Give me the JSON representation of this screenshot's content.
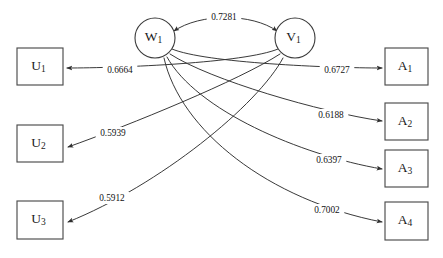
{
  "diagram": {
    "type": "path-diagram",
    "background_color": "#ffffff",
    "stroke_color": "#2e2e2e",
    "latent_nodes": [
      {
        "id": "W1",
        "base": "W",
        "subscript": "1",
        "shape": "circle",
        "cx": 155,
        "cy": 38,
        "r": 20
      },
      {
        "id": "V1",
        "base": "V",
        "subscript": "1",
        "shape": "circle",
        "cx": 295,
        "cy": 38,
        "r": 20
      }
    ],
    "left_nodes": [
      {
        "id": "U1",
        "base": "U",
        "subscript": "1",
        "shape": "rect",
        "x": 17,
        "y": 48,
        "w": 46,
        "h": 37
      },
      {
        "id": "U2",
        "base": "U",
        "subscript": "2",
        "shape": "rect",
        "x": 17,
        "y": 125,
        "w": 46,
        "h": 37
      },
      {
        "id": "U3",
        "base": "U",
        "subscript": "3",
        "shape": "rect",
        "x": 17,
        "y": 201,
        "w": 46,
        "h": 38
      }
    ],
    "right_nodes": [
      {
        "id": "A1",
        "base": "A",
        "subscript": "1",
        "shape": "rect",
        "x": 385,
        "y": 48,
        "w": 43,
        "h": 37
      },
      {
        "id": "A2",
        "base": "A",
        "subscript": "2",
        "shape": "rect",
        "x": 385,
        "y": 103,
        "w": 43,
        "h": 37
      },
      {
        "id": "A3",
        "base": "A",
        "subscript": "3",
        "shape": "rect",
        "x": 385,
        "y": 150,
        "w": 43,
        "h": 37
      },
      {
        "id": "A4",
        "base": "A",
        "subscript": "4",
        "shape": "rect",
        "x": 385,
        "y": 202,
        "w": 43,
        "h": 38
      }
    ],
    "edges": [
      {
        "name": "edge-W1-V1",
        "from": "W1",
        "to": "V1",
        "coefficient": "0.7281",
        "bidirectional": true,
        "label_x": 224,
        "label_y": 17,
        "path": "M 174 31 C 200 13, 252 13, 277 31"
      },
      {
        "name": "edge-V1-U1",
        "from": "V1",
        "to": "U1",
        "coefficient": "0.6664",
        "bidirectional": false,
        "label_x": 120,
        "label_y": 70,
        "path": "M 278 49 C 245 63, 120 68, 67 68"
      },
      {
        "name": "edge-V1-U2",
        "from": "V1",
        "to": "U2",
        "coefficient": "0.5939",
        "bidirectional": false,
        "label_x": 113,
        "label_y": 133,
        "path": "M 280 54 C 240 80, 130 125, 68 147"
      },
      {
        "name": "edge-V1-U3",
        "from": "V1",
        "to": "U3",
        "coefficient": "0.5912",
        "bidirectional": false,
        "label_x": 112,
        "label_y": 198,
        "path": "M 283 58 C 258 105, 160 185, 68 222"
      },
      {
        "name": "edge-W1-A1",
        "from": "W1",
        "to": "A1",
        "coefficient": "0.6727",
        "bidirectional": false,
        "label_x": 337,
        "label_y": 70,
        "path": "M 172 49 C 205 63, 330 68, 382 68"
      },
      {
        "name": "edge-W1-A2",
        "from": "W1",
        "to": "A2",
        "coefficient": "0.6188",
        "bidirectional": false,
        "label_x": 331,
        "label_y": 115,
        "path": "M 170 54 C 210 80, 320 112, 382 121"
      },
      {
        "name": "edge-W1-A3",
        "from": "W1",
        "to": "A3",
        "coefficient": "0.6397",
        "bidirectional": false,
        "label_x": 329,
        "label_y": 160,
        "path": "M 167 57 C 196 110, 300 155, 382 169"
      },
      {
        "name": "edge-W1-A4",
        "from": "W1",
        "to": "A4",
        "coefficient": "0.7002",
        "bidirectional": false,
        "label_x": 327,
        "label_y": 210,
        "path": "M 164 58 C 180 130, 268 200, 382 222"
      }
    ]
  }
}
